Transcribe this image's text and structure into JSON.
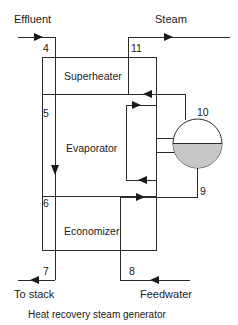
{
  "diagram": {
    "caption": "Heat recovery steam generator",
    "inlets_outlets": {
      "effluent": "Effluent",
      "steam": "Steam",
      "to_stack": "To stack",
      "feedwater": "Feedwater"
    },
    "components": [
      {
        "id": "superheater",
        "label": "Superheater"
      },
      {
        "id": "evaporator",
        "label": "Evaporator"
      },
      {
        "id": "economizer",
        "label": "Economizer"
      }
    ],
    "state_points": [
      {
        "id": "sp-4",
        "label": "4",
        "stream": "gas-inlet"
      },
      {
        "id": "sp-5",
        "label": "5",
        "stream": "gas-superheater-to-evaporator"
      },
      {
        "id": "sp-6",
        "label": "6",
        "stream": "gas-evaporator-to-economizer"
      },
      {
        "id": "sp-7",
        "label": "7",
        "stream": "gas-outlet-to-stack"
      },
      {
        "id": "sp-8",
        "label": "8",
        "stream": "feedwater-inlet"
      },
      {
        "id": "sp-9",
        "label": "9",
        "stream": "economizer-to-drum"
      },
      {
        "id": "sp-10",
        "label": "10",
        "stream": "steam-drum"
      },
      {
        "id": "sp-11",
        "label": "11",
        "stream": "superheated-steam-outlet"
      }
    ],
    "colors": {
      "line": "#2b2b2b",
      "text": "#1a1a1a",
      "drum_water": "#c7c7c7",
      "background": "#ffffff"
    }
  }
}
